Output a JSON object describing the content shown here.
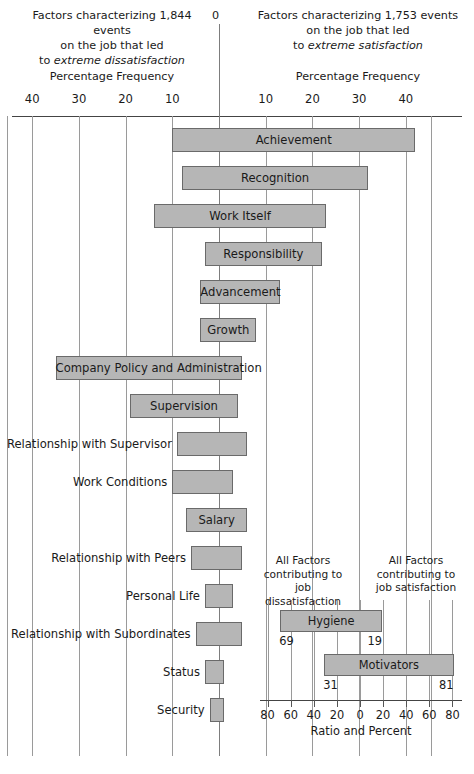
{
  "header": {
    "left_line1": "Factors characterizing 1,844 events",
    "left_line2": "on the job that led",
    "left_line3_prefix": "to ",
    "left_line3_italic": "extreme dissatisfaction",
    "right_line1": "Factors characterizing 1,753 events",
    "right_line2": "on the job that led",
    "right_line3_prefix": "to ",
    "right_line3_italic": "extreme satisfaction",
    "zero_label": "0",
    "axis_label_left": "Percentage Frequency",
    "axis_label_right": "Percentage Frequency"
  },
  "chart_data": {
    "type": "bar",
    "orientation": "horizontal-diverging",
    "xlabel": "Percentage Frequency",
    "ylabel": "",
    "grid": true,
    "xlim": [
      -45,
      45
    ],
    "left_axis_ticks": [
      40,
      30,
      20,
      10
    ],
    "right_axis_ticks": [
      10,
      20,
      30,
      40
    ],
    "center_tick": 0,
    "legend_position": "none",
    "series": [
      {
        "name": "dissatisfaction",
        "side": "left"
      },
      {
        "name": "satisfaction",
        "side": "right"
      }
    ],
    "categories": [
      "Achievement",
      "Recognition",
      "Work Itself",
      "Responsibility",
      "Advancement",
      "Growth",
      "Company Policy and Administration",
      "Supervision",
      "Relationship with Supervisor",
      "Work Conditions",
      "Salary",
      "Relationship with Peers",
      "Personal Life",
      "Relationship with Subordinates",
      "Status",
      "Security"
    ],
    "bars": [
      {
        "label": "Achievement",
        "left": 10,
        "right": 42,
        "label_pos": "inside"
      },
      {
        "label": "Recognition",
        "left": 8,
        "right": 32,
        "label_pos": "inside"
      },
      {
        "label": "Work Itself",
        "left": 14,
        "right": 23,
        "label_pos": "inside"
      },
      {
        "label": "Responsibility",
        "left": 3,
        "right": 22,
        "label_pos": "inside"
      },
      {
        "label": "Advancement",
        "left": 4,
        "right": 13,
        "label_pos": "inside"
      },
      {
        "label": "Growth",
        "left": 4,
        "right": 8,
        "label_pos": "inside"
      },
      {
        "label": "Company Policy and Administration",
        "left": 35,
        "right": 5,
        "label_pos": "inside"
      },
      {
        "label": "Supervision",
        "left": 19,
        "right": 4,
        "label_pos": "inside"
      },
      {
        "label": "Relationship with Supervisor",
        "left": 9,
        "right": 6,
        "label_pos": "outside"
      },
      {
        "label": "Work Conditions",
        "left": 10,
        "right": 3,
        "label_pos": "outside"
      },
      {
        "label": "Salary",
        "left": 7,
        "right": 6,
        "label_pos": "inside"
      },
      {
        "label": "Relationship with Peers",
        "left": 6,
        "right": 5,
        "label_pos": "outside"
      },
      {
        "label": "Personal Life",
        "left": 3,
        "right": 3,
        "label_pos": "outside"
      },
      {
        "label": "Relationship with Subordinates",
        "left": 5,
        "right": 5,
        "label_pos": "outside"
      },
      {
        "label": "Status",
        "left": 3,
        "right": 1,
        "label_pos": "outside"
      },
      {
        "label": "Security",
        "left": 2,
        "right": 1,
        "label_pos": "outside"
      }
    ]
  },
  "inset": {
    "header_left_l1": "All Factors",
    "header_left_l2": "contributing to",
    "header_left_l3": "job dissatisfaction",
    "header_right_l1": "All Factors",
    "header_right_l2": "contributing to",
    "header_right_l3": "job satisfaction",
    "xlabel": "Ratio and Percent",
    "ticks": [
      "80",
      "60",
      "40",
      "20",
      "0",
      "20",
      "40",
      "60",
      "80"
    ],
    "chart_data": {
      "type": "bar",
      "orientation": "horizontal-diverging",
      "xlim": [
        -90,
        90
      ],
      "xlabel": "Ratio and Percent",
      "bars": [
        {
          "label": "Hygiene",
          "left": 69,
          "right": 19,
          "left_value": "69",
          "right_value": "19"
        },
        {
          "label": "Motivators",
          "left": 31,
          "right": 81,
          "left_value": "31",
          "right_value": "81"
        }
      ]
    }
  }
}
